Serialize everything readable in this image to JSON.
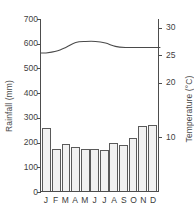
{
  "chart_data": {
    "type": "bar",
    "title": "",
    "categories": [
      "J",
      "F",
      "M",
      "A",
      "M",
      "J",
      "J",
      "A",
      "S",
      "O",
      "N",
      "D"
    ],
    "month_names": [
      "January",
      "February",
      "March",
      "April",
      "May",
      "June",
      "July",
      "August",
      "September",
      "October",
      "November",
      "December"
    ],
    "series": [
      {
        "name": "Rainfall",
        "chart_type": "bar",
        "axis": "left",
        "unit": "mm",
        "values": [
          255,
          172,
          192,
          180,
          170,
          170,
          165,
          196,
          185,
          214,
          265,
          268
        ]
      },
      {
        "name": "Temperature",
        "chart_type": "line",
        "axis": "right",
        "unit": "°C",
        "values": [
          25.4,
          25.7,
          26.4,
          27.3,
          27.5,
          27.5,
          27.2,
          26.6,
          26.4,
          26.4,
          26.4,
          26.4
        ]
      }
    ],
    "xlabel": "",
    "ylabel": "Rainfall (mm)",
    "y2label": "Temperature (°C)",
    "ylim": [
      0,
      700
    ],
    "y2lim": [
      0,
      31.6
    ],
    "yticks": [
      0,
      100,
      200,
      300,
      400,
      500,
      600,
      700
    ],
    "y2ticks": [
      10,
      20,
      25,
      30
    ],
    "grid": false,
    "legend": "none"
  },
  "axes": {
    "left": {
      "title": "Rainfall (mm)",
      "ticks": [
        {
          "label": "700",
          "value": 700
        },
        {
          "label": "600",
          "value": 600
        },
        {
          "label": "500",
          "value": 500
        },
        {
          "label": "400",
          "value": 400
        },
        {
          "label": "300",
          "value": 300
        },
        {
          "label": "200",
          "value": 200
        },
        {
          "label": "100",
          "value": 100
        },
        {
          "label": "0",
          "value": 0
        }
      ]
    },
    "right": {
      "title": "Temperature (°C)",
      "ticks": [
        {
          "label": "30",
          "value": 30
        },
        {
          "label": "25",
          "value": 25
        },
        {
          "label": "20",
          "value": 20
        },
        {
          "label": "10",
          "value": 10
        }
      ]
    },
    "bottom": {
      "ticks": [
        "J",
        "F",
        "M",
        "A",
        "M",
        "J",
        "J",
        "A",
        "S",
        "O",
        "N",
        "D"
      ]
    }
  },
  "style": {
    "bar_fill": "#f2f2f2",
    "bar_stroke": "#5a5a5a",
    "axis_color": "#4d4d4d",
    "curve_color": "#4a4a4a",
    "text_color": "#3a3a3a",
    "background": "#ffffff"
  }
}
